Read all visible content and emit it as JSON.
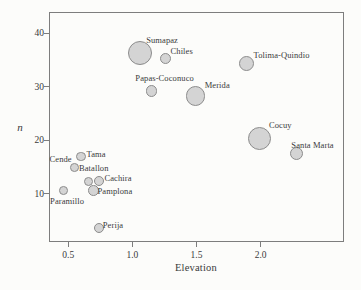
{
  "chart_data": {
    "type": "scatter",
    "title": "",
    "xlabel": "Elevation",
    "ylabel": "n",
    "xlim": [
      0.35,
      2.65
    ],
    "ylim": [
      1,
      44
    ],
    "grid": false,
    "legend": "none",
    "x_ticks": [
      0.5,
      1.0,
      1.5,
      2.0
    ],
    "x_tick_labels": [
      "0.5",
      "1.0",
      "1.5",
      "2.0"
    ],
    "y_ticks": [
      10,
      20,
      30,
      40
    ],
    "y_tick_labels": [
      "10",
      "20",
      "30",
      "40"
    ],
    "series_note": "bubble size varies by site; values in px radius",
    "points": [
      {
        "label": "Sumapaz",
        "x": 1.06,
        "y": 36.4,
        "r": 12.0,
        "label_dx": 22,
        "label_dy": -13
      },
      {
        "label": "Chiles",
        "x": 1.26,
        "y": 35.3,
        "r": 5.7,
        "label_dx": 16,
        "label_dy": -8
      },
      {
        "label": "Papas-Coconuco",
        "x": 1.15,
        "y": 29.2,
        "r": 5.7,
        "label_dx": 13,
        "label_dy": -13
      },
      {
        "label": "Tolima-Quindio",
        "x": 1.89,
        "y": 34.4,
        "r": 7.5,
        "label_dx": 35,
        "label_dy": -8
      },
      {
        "label": "Merida",
        "x": 1.49,
        "y": 28.3,
        "r": 9.7,
        "label_dx": 22,
        "label_dy": -11
      },
      {
        "label": "Cocuy",
        "x": 1.99,
        "y": 20.4,
        "r": 11.7,
        "label_dx": 21,
        "label_dy": -13
      },
      {
        "label": "Santa Marta",
        "x": 2.28,
        "y": 17.5,
        "r": 6.7,
        "label_dx": 16,
        "label_dy": -9
      },
      {
        "label": "Tama",
        "x": 0.6,
        "y": 17.0,
        "r": 4.6,
        "label_dx": 15,
        "label_dy": -2
      },
      {
        "label": "Cende",
        "x": 0.55,
        "y": 15.0,
        "r": 4.4,
        "label_dx": -14,
        "label_dy": -8
      },
      {
        "label": "Batallon",
        "x": 0.66,
        "y": 12.3,
        "r": 4.7,
        "label_dx": 5,
        "label_dy": -14
      },
      {
        "label": "Cachira",
        "x": 0.74,
        "y": 12.4,
        "r": 5.0,
        "label_dx": 19,
        "label_dy": -3
      },
      {
        "label": "Pamplona",
        "x": 0.7,
        "y": 10.6,
        "r": 5.4,
        "label_dx": 21,
        "label_dy": 0
      },
      {
        "label": "Paramillo",
        "x": 0.46,
        "y": 10.7,
        "r": 4.4,
        "label_dx": 4,
        "label_dy": 11
      },
      {
        "label": "Perija",
        "x": 0.74,
        "y": 3.6,
        "r": 5.3,
        "label_dx": 14,
        "label_dy": -3
      }
    ],
    "colors": {
      "background": "#fcfcfa",
      "axis": "#7d7d7d",
      "text": "#3a3a3a",
      "bubble_fill": "#d4d4d4",
      "bubble_stroke": "#8c8c8c"
    }
  }
}
